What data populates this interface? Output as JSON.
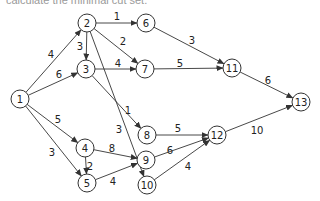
{
  "caption": "calculate the minimal cut set.",
  "graph": {
    "nodes": [
      {
        "id": "1",
        "label": "1",
        "x": 20,
        "y": 99
      },
      {
        "id": "2",
        "label": "2",
        "x": 87,
        "y": 23
      },
      {
        "id": "3",
        "label": "3",
        "x": 86,
        "y": 69
      },
      {
        "id": "6",
        "label": "6",
        "x": 146,
        "y": 23
      },
      {
        "id": "7",
        "label": "7",
        "x": 145,
        "y": 69
      },
      {
        "id": "11",
        "label": "11",
        "x": 232,
        "y": 68
      },
      {
        "id": "13",
        "label": "13",
        "x": 301,
        "y": 102
      },
      {
        "id": "8",
        "label": "8",
        "x": 147,
        "y": 135
      },
      {
        "id": "4",
        "label": "4",
        "x": 85,
        "y": 148
      },
      {
        "id": "9",
        "label": "9",
        "x": 146,
        "y": 160
      },
      {
        "id": "12",
        "label": "12",
        "x": 217,
        "y": 135
      },
      {
        "id": "5",
        "label": "5",
        "x": 87,
        "y": 183
      },
      {
        "id": "10",
        "label": "10",
        "x": 147,
        "y": 185
      }
    ],
    "edges": [
      {
        "from": "1",
        "to": "2",
        "weight": "4",
        "lx": 51,
        "ly": 54
      },
      {
        "from": "1",
        "to": "3",
        "weight": "6",
        "lx": 59,
        "ly": 74
      },
      {
        "from": "1",
        "to": "4",
        "weight": "5",
        "lx": 58,
        "ly": 119
      },
      {
        "from": "1",
        "to": "5",
        "weight": "3",
        "lx": 52,
        "ly": 152
      },
      {
        "from": "2",
        "to": "6",
        "weight": "1",
        "lx": 117,
        "ly": 16
      },
      {
        "from": "2",
        "to": "3",
        "weight": "3",
        "lx": 80,
        "ly": 46
      },
      {
        "from": "2",
        "to": "7",
        "weight": "2",
        "lx": 123,
        "ly": 41
      },
      {
        "from": "2",
        "to": "10",
        "weight": "3",
        "lx": 119,
        "ly": 129
      },
      {
        "from": "3",
        "to": "7",
        "weight": "4",
        "lx": 118,
        "ly": 63
      },
      {
        "from": "3",
        "to": "8",
        "weight": "1",
        "lx": 128,
        "ly": 110
      },
      {
        "from": "6",
        "to": "11",
        "weight": "3",
        "lx": 192,
        "ly": 40
      },
      {
        "from": "7",
        "to": "11",
        "weight": "5",
        "lx": 180,
        "ly": 63
      },
      {
        "from": "11",
        "to": "13",
        "weight": "6",
        "lx": 268,
        "ly": 80
      },
      {
        "from": "8",
        "to": "12",
        "weight": "5",
        "lx": 178,
        "ly": 128
      },
      {
        "from": "4",
        "to": "9",
        "weight": "8",
        "lx": 112,
        "ly": 148
      },
      {
        "from": "4",
        "to": "5",
        "weight": "2",
        "lx": 90,
        "ly": 166
      },
      {
        "from": "5",
        "to": "9",
        "weight": "4",
        "lx": 113,
        "ly": 181
      },
      {
        "from": "9",
        "to": "12",
        "weight": "6",
        "lx": 170,
        "ly": 150
      },
      {
        "from": "10",
        "to": "12",
        "weight": "4",
        "lx": 188,
        "ly": 166
      },
      {
        "from": "12",
        "to": "13",
        "weight": "10",
        "lx": 257,
        "ly": 130
      }
    ]
  },
  "colors": {
    "stroke": "#333333",
    "text": "#222222",
    "background": "#ffffff"
  }
}
